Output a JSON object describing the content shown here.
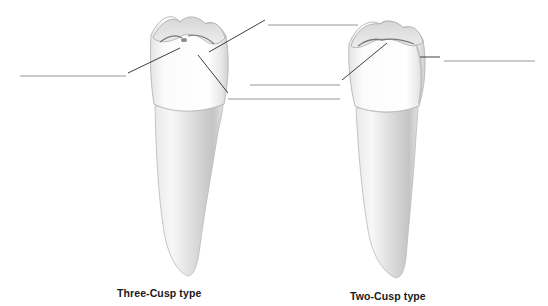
{
  "figure": {
    "background_color": "#ffffff",
    "line_color": "#2a2a2a",
    "blank_line_color": "#8a8a8a"
  },
  "teeth": [
    {
      "id": "three-cusp",
      "caption": "Three-Cusp type",
      "cusp_count": 3
    },
    {
      "id": "two-cusp",
      "caption": "Two-Cusp type",
      "cusp_count": 2
    }
  ],
  "label_blanks": [
    {
      "id": "blank-1",
      "tooth": "three-cusp",
      "side": "left",
      "text": ""
    },
    {
      "id": "blank-2",
      "tooth": "three-cusp",
      "side": "top-right",
      "text": ""
    },
    {
      "id": "blank-3",
      "tooth": "two-cusp",
      "side": "mid-left",
      "text": ""
    },
    {
      "id": "blank-4",
      "tooth": "three-cusp",
      "side": "lower-right",
      "text": ""
    },
    {
      "id": "blank-5",
      "tooth": "two-cusp",
      "side": "right",
      "text": ""
    }
  ]
}
